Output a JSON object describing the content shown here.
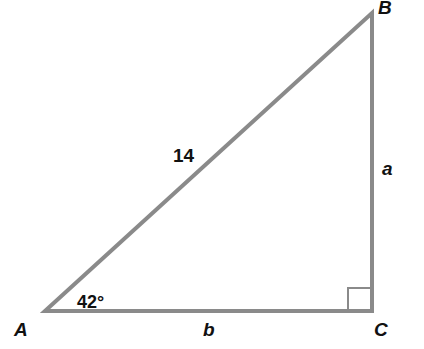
{
  "diagram": {
    "type": "right-triangle",
    "colors": {
      "line": "#8a8a8a",
      "text": "#111111"
    },
    "vertices": {
      "A": {
        "label": "A",
        "x": 45,
        "y": 311
      },
      "B": {
        "label": "B",
        "x": 372,
        "y": 13
      },
      "C": {
        "label": "C",
        "x": 372,
        "y": 311
      }
    },
    "sides": {
      "hypotenuse": {
        "label": "14"
      },
      "vertical": {
        "label": "a"
      },
      "horizontal": {
        "label": "b"
      }
    },
    "angle_A": {
      "label": "42°"
    },
    "right_angle_at": "C"
  }
}
